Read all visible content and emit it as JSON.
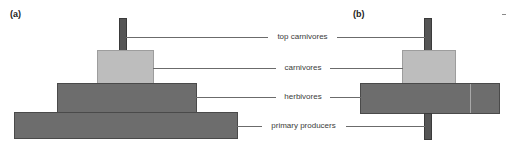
{
  "figure": {
    "background_color": "#ffffff",
    "type": "ecological-pyramid-diagram",
    "panels": [
      {
        "id": "a",
        "letter": "(a)",
        "shape": "upright pyramid",
        "levels": [
          {
            "name": "top carnivores",
            "style": "bar",
            "color": "#555555"
          },
          {
            "name": "carnivores",
            "style": "light",
            "color": "#bdbdbd"
          },
          {
            "name": "herbivores",
            "style": "dark",
            "color": "#6d6d6d"
          },
          {
            "name": "primary producers",
            "style": "dark",
            "color": "#6d6d6d"
          }
        ]
      },
      {
        "id": "b",
        "letter": "(b)",
        "shape": "inverted pyramid",
        "levels": [
          {
            "name": "top carnivores",
            "style": "bar",
            "color": "#555555"
          },
          {
            "name": "carnivores",
            "style": "light",
            "color": "#bdbdbd"
          },
          {
            "name": "herbivores",
            "style": "dark",
            "color": "#6d6d6d"
          },
          {
            "name": "primary producers",
            "style": "bar",
            "color": "#555555"
          }
        ]
      }
    ]
  },
  "labels": {
    "top_carnivores": "top carnivores",
    "carnivores": "carnivores",
    "herbivores": "herbivores",
    "primary_producers": "primary producers"
  },
  "chart_data": {
    "type": "bar",
    "title": "",
    "xlabel": "",
    "ylabel": "",
    "categories": [
      "top carnivores",
      "carnivores",
      "herbivores",
      "primary producers"
    ],
    "series": [
      {
        "name": "(a) upright pyramid",
        "values": [
          8,
          57,
          140,
          224
        ]
      },
      {
        "name": "(b) inverted pyramid",
        "values": [
          8,
          54,
          140,
          8
        ]
      }
    ],
    "units": "relative biomass (bar width, px)",
    "legend": "none",
    "grid": false
  }
}
